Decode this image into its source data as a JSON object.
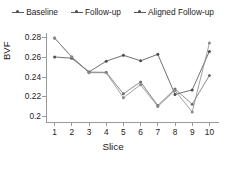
{
  "chart_data": {
    "type": "line",
    "title": "",
    "xlabel": "Slice",
    "ylabel": "BVF",
    "x": [
      1,
      2,
      3,
      4,
      5,
      6,
      7,
      8,
      9,
      10
    ],
    "xtick_labels": [
      "1",
      "2",
      "3",
      "4",
      "5",
      "6",
      "7",
      "8",
      "9",
      "10"
    ],
    "ytick_labels": [
      "0.28",
      "0.26",
      "0.24",
      "0.22",
      "0.2"
    ],
    "ytick_values": [
      0.28,
      0.26,
      0.24,
      0.22,
      0.2
    ],
    "ylim": [
      0.195,
      0.285
    ],
    "xlim": [
      0.5,
      10.5
    ],
    "grid": false,
    "legend_position": "top-center",
    "series": [
      {
        "name": "Baseline",
        "color": "#4d4d4d",
        "marker": "circle",
        "values": [
          0.2605,
          0.2592,
          0.2452,
          0.2562,
          0.2622,
          0.2566,
          0.2632,
          0.2222,
          0.2268,
          0.2662
        ]
      },
      {
        "name": "Follow-up",
        "color": "#6e6e6e",
        "marker": "circle",
        "values": [
          0.2798,
          0.2604,
          0.245,
          0.2448,
          0.2228,
          0.235,
          0.2108,
          0.2278,
          0.2122,
          0.2415
        ]
      },
      {
        "name": "Aligned Follow-up",
        "color": "#8a8a8a",
        "marker": "circle",
        "values": [
          0.2798,
          0.2604,
          0.2444,
          0.2444,
          0.2188,
          0.2322,
          0.2098,
          0.2262,
          0.2042,
          0.2748
        ]
      }
    ]
  },
  "legend": {
    "items": [
      {
        "label": "Baseline"
      },
      {
        "label": "Follow-up"
      },
      {
        "label": "Aligned Follow-up"
      }
    ]
  },
  "axes": {
    "y_title": "BVF",
    "x_title": "Slice"
  },
  "colors": {
    "axis": "#9a9a9a",
    "text": "#1c1c1c",
    "background": "#ffffff"
  }
}
